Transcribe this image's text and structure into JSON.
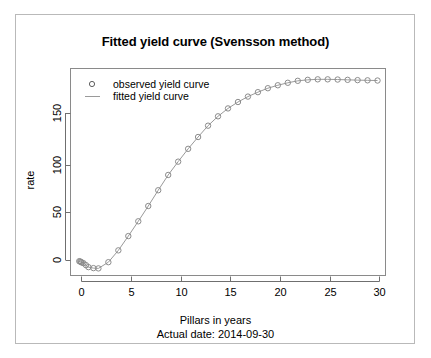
{
  "figure": {
    "title": "Fitted yield curve (Svensson method)",
    "xlabel": "Pillars in years",
    "sub_caption": "Actual date:  2014-09-30",
    "ylabel": "rate",
    "legend": {
      "observed_label": "observed yield curve",
      "fitted_label": "fitted yield curve",
      "observed_marker": "circle-marker-icon",
      "fitted_marker": "line-marker-icon"
    },
    "colors": {
      "marker_stroke": "#8c8c8c",
      "line": "#9a9a9a",
      "axis": "#6f6f6f",
      "frame": "#8a8a8a",
      "outer_border": "#b9b9b9",
      "text": "#000000",
      "background": "#ffffff"
    }
  },
  "chart_data": {
    "type": "scatter",
    "title": "Fitted yield curve (Svensson method)",
    "subtitle": "Actual date:  2014-09-30",
    "xlabel": "Pillars in years",
    "ylabel": "rate",
    "grid": false,
    "legend_position": "top-left-inside",
    "xlim": [
      -0.8,
      30.8
    ],
    "ylim": [
      -14,
      196
    ],
    "xticks": [
      0,
      5,
      10,
      15,
      20,
      25,
      30
    ],
    "yticks": [
      0,
      50,
      100,
      150
    ],
    "series": [
      {
        "name": "observed yield curve",
        "marker": "open-circle",
        "x": [
          0.08,
          0.17,
          0.25,
          0.33,
          0.5,
          0.75,
          1.0,
          1.5,
          2.0,
          3.0,
          4.0,
          5.0,
          6.0,
          7.0,
          8.0,
          9.0,
          10.0,
          11.0,
          12.0,
          13.0,
          14.0,
          15.0,
          16.0,
          17.0,
          18.0,
          19.0,
          20.0,
          21.0,
          22.0,
          23.0,
          24.0,
          25.0,
          26.0,
          27.0,
          28.0,
          29.0,
          30.0
        ],
        "y": [
          0.5,
          0.2,
          -0.3,
          -0.8,
          -1.5,
          -3.5,
          -5.5,
          -6.5,
          -6.8,
          -0.5,
          11.5,
          26.0,
          41.0,
          56.5,
          72.5,
          88.0,
          101.5,
          114.5,
          126.5,
          138.0,
          147.5,
          155.5,
          162.0,
          167.5,
          172.0,
          176.0,
          179.0,
          181.5,
          183.5,
          184.5,
          185.0,
          185.0,
          184.8,
          184.5,
          184.2,
          184.0,
          183.8
        ]
      },
      {
        "name": "fitted yield curve",
        "marker": "line",
        "x": [
          0.08,
          0.17,
          0.25,
          0.33,
          0.5,
          0.75,
          1.0,
          1.5,
          2.0,
          3.0,
          4.0,
          5.0,
          6.0,
          7.0,
          8.0,
          9.0,
          10.0,
          11.0,
          12.0,
          13.0,
          14.0,
          15.0,
          16.0,
          17.0,
          18.0,
          19.0,
          20.0,
          21.0,
          22.0,
          23.0,
          24.0,
          25.0,
          26.0,
          27.0,
          28.0,
          29.0,
          30.0
        ],
        "y": [
          0.5,
          0.2,
          -0.3,
          -0.8,
          -1.5,
          -3.5,
          -5.5,
          -6.5,
          -6.8,
          -0.5,
          11.5,
          26.0,
          41.0,
          56.5,
          72.5,
          88.0,
          101.5,
          114.5,
          126.5,
          138.0,
          147.5,
          155.5,
          162.0,
          167.5,
          172.0,
          176.0,
          179.0,
          181.5,
          183.5,
          184.5,
          185.0,
          185.0,
          184.8,
          184.5,
          184.2,
          184.0,
          183.8
        ]
      }
    ]
  }
}
